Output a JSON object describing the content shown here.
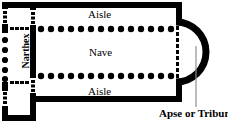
{
  "diagram": {
    "type": "architectural-floor-plan",
    "colors": {
      "wall": "#000000",
      "background": "#ffffff",
      "column": "#000000",
      "leader_line": "#888888",
      "opening_dash": "#000000"
    },
    "labels": {
      "aisle_top": "Aisle",
      "nave": "Nave",
      "aisle_bottom": "Aisle",
      "narthex": "Narthex",
      "apse": "Apse or Tribune"
    },
    "structure": {
      "outer_wall_thickness": 6,
      "colonnade_top_count": 14,
      "colonnade_bottom_count": 14,
      "portico_column_count": 5,
      "apse_shape": "semicircular",
      "narthex_doorways": 4,
      "nave_arcade_rows": 2
    }
  }
}
